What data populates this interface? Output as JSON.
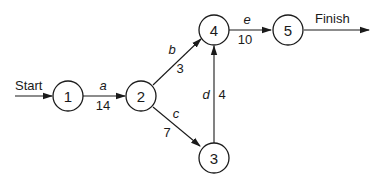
{
  "diagram": {
    "type": "activity-network",
    "start_label": "Start",
    "finish_label": "Finish",
    "nodes": [
      {
        "id": "1",
        "label": "1"
      },
      {
        "id": "2",
        "label": "2"
      },
      {
        "id": "3",
        "label": "3"
      },
      {
        "id": "4",
        "label": "4"
      },
      {
        "id": "5",
        "label": "5"
      }
    ],
    "edges": [
      {
        "from": "1",
        "to": "2",
        "name": "a",
        "weight": "14"
      },
      {
        "from": "2",
        "to": "4",
        "name": "b",
        "weight": "3"
      },
      {
        "from": "2",
        "to": "3",
        "name": "c",
        "weight": "7"
      },
      {
        "from": "3",
        "to": "4",
        "name": "d",
        "weight": "4"
      },
      {
        "from": "4",
        "to": "5",
        "name": "e",
        "weight": "10"
      }
    ],
    "colors": {
      "stroke": "#1a1a1a",
      "background": "#ffffff"
    }
  }
}
